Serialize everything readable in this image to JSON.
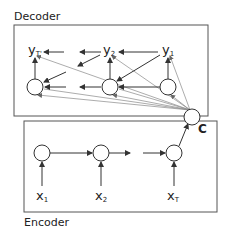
{
  "decoder": {
    "label": "Decoder",
    "outputs": [
      {
        "main": "y",
        "sub": "T'"
      },
      {
        "main": "y",
        "sub": "2"
      },
      {
        "main": "y",
        "sub": "1"
      }
    ]
  },
  "encoder": {
    "label": "Encoder",
    "inputs": [
      {
        "main": "x",
        "sub": "1"
      },
      {
        "main": "x",
        "sub": "2"
      },
      {
        "main": "x",
        "sub": "T"
      }
    ]
  },
  "context": {
    "label": "C"
  },
  "colors": {
    "stroke": "#333333",
    "context_lines": "#888888",
    "box": "#555555"
  }
}
